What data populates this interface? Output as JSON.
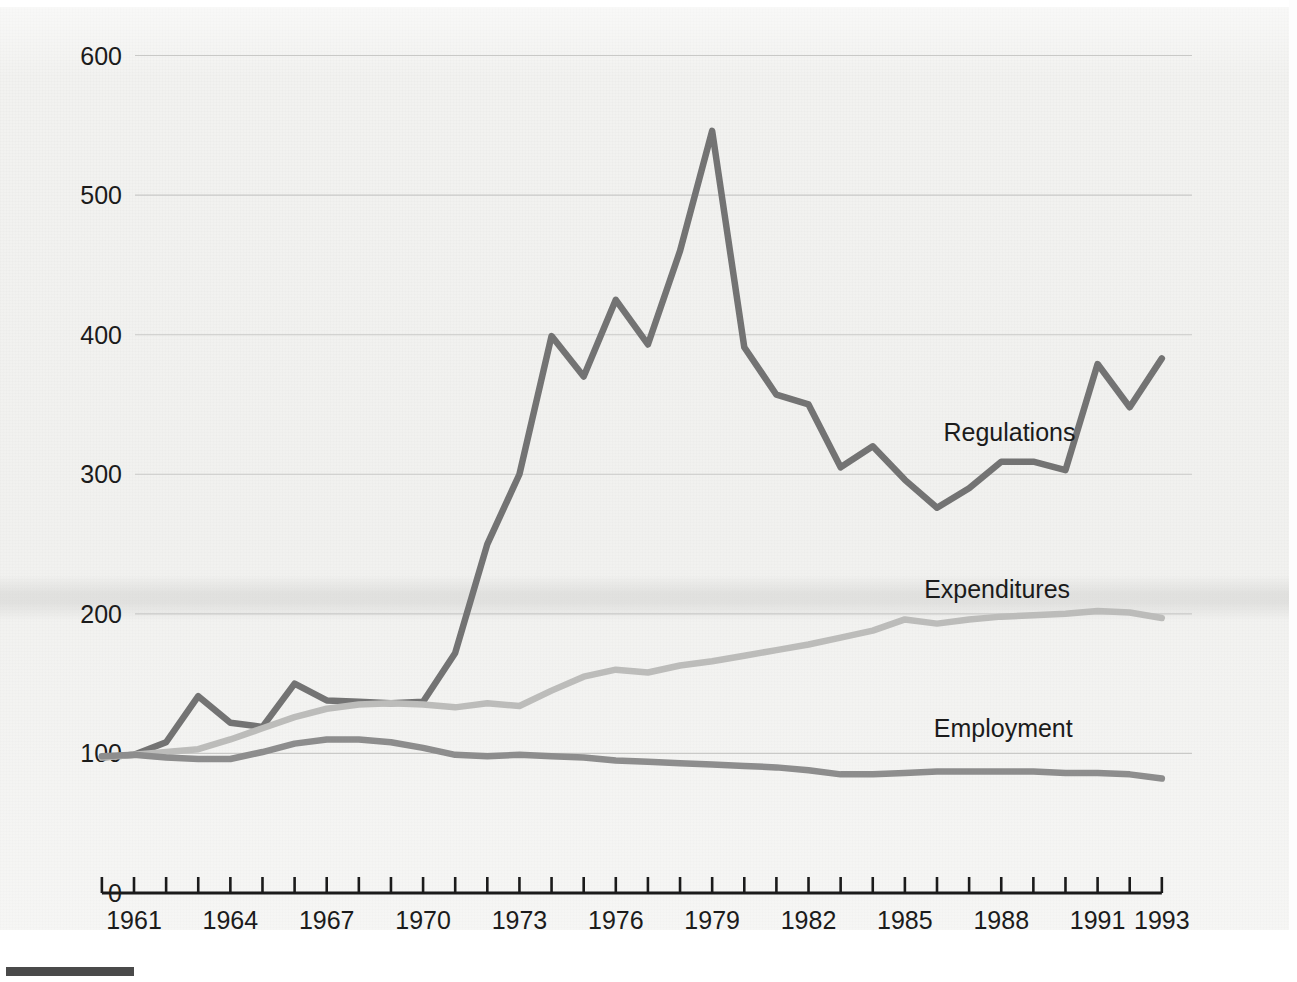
{
  "chart_data": {
    "type": "line",
    "title": "",
    "subtitle": "",
    "xlabel": "",
    "ylabel": "",
    "xlim": [
      1960,
      1993
    ],
    "ylim": [
      0,
      600
    ],
    "yticks": [
      0,
      100,
      200,
      300,
      400,
      500,
      600
    ],
    "ytick_labels": [
      "0",
      "100",
      "200",
      "300",
      "400",
      "500",
      "600"
    ],
    "xticks": [
      1960,
      1961,
      1962,
      1963,
      1964,
      1965,
      1966,
      1967,
      1968,
      1969,
      1970,
      1971,
      1972,
      1973,
      1974,
      1975,
      1976,
      1977,
      1978,
      1979,
      1980,
      1981,
      1982,
      1983,
      1984,
      1985,
      1986,
      1987,
      1988,
      1989,
      1990,
      1991,
      1992,
      1993
    ],
    "xtick_labels": [
      "1961",
      "1964",
      "1967",
      "1970",
      "1973",
      "1976",
      "1979",
      "1982",
      "1985",
      "1988",
      "1991",
      "1993"
    ],
    "xtick_label_years": [
      1961,
      1964,
      1967,
      1970,
      1973,
      1976,
      1979,
      1982,
      1985,
      1988,
      1991,
      1993
    ],
    "grid": "horizontal",
    "legend_position": "inline-right",
    "x": [
      1960,
      1961,
      1962,
      1963,
      1964,
      1965,
      1966,
      1967,
      1968,
      1969,
      1970,
      1971,
      1972,
      1973,
      1974,
      1975,
      1976,
      1977,
      1978,
      1979,
      1980,
      1981,
      1982,
      1983,
      1984,
      1985,
      1986,
      1987,
      1988,
      1989,
      1990,
      1991,
      1992,
      1993
    ],
    "series": [
      {
        "name": "Regulations",
        "color": "#737373",
        "width": 6.5,
        "label_x": 1986.2,
        "label_y": 330,
        "values": [
          97,
          99,
          108,
          141,
          122,
          119,
          150,
          138,
          137,
          136,
          137,
          172,
          250,
          300,
          399,
          370,
          425,
          393,
          460,
          546,
          391,
          357,
          350,
          305,
          320,
          296,
          276,
          290,
          309,
          309,
          303,
          379,
          348,
          383
        ]
      },
      {
        "name": "Expenditures",
        "color": "#bcbcba",
        "width": 6.5,
        "label_x": 1985.6,
        "label_y": 218,
        "values": [
          97,
          99,
          101,
          103,
          110,
          118,
          126,
          132,
          135,
          136,
          135,
          133,
          136,
          134,
          145,
          155,
          160,
          158,
          163,
          166,
          170,
          174,
          178,
          183,
          188,
          196,
          193,
          196,
          198,
          199,
          200,
          202,
          201,
          197
        ]
      },
      {
        "name": "Employment",
        "color": "#8d8d8d",
        "width": 6.5,
        "label_x": 1985.9,
        "label_y": 118,
        "values": [
          98,
          99,
          97,
          96,
          96,
          101,
          107,
          110,
          110,
          108,
          104,
          99,
          98,
          99,
          98,
          97,
          95,
          94,
          93,
          92,
          91,
          90,
          88,
          85,
          85,
          86,
          87,
          87,
          87,
          87,
          86,
          86,
          85,
          82
        ]
      }
    ]
  },
  "axis": {
    "y_axis_name": "value-axis",
    "x_axis_name": "year-axis"
  },
  "decorations": {
    "footer_rule_name": "footer-rule"
  }
}
